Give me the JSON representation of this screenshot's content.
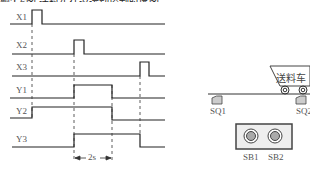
{
  "top_text": "题2-6图 送料车往返运动控制时序图",
  "timing": {
    "signals": [
      {
        "name": "X1"
      },
      {
        "name": "X2"
      },
      {
        "name": "X3"
      },
      {
        "name": "Y1"
      },
      {
        "name": "Y2"
      },
      {
        "name": "Y3"
      }
    ],
    "delay_label": "2s"
  },
  "machine": {
    "cart_label": "送料车",
    "limit_switches": [
      "SQ1",
      "SQ2"
    ],
    "buttons": [
      "SB1",
      "SB2"
    ]
  }
}
